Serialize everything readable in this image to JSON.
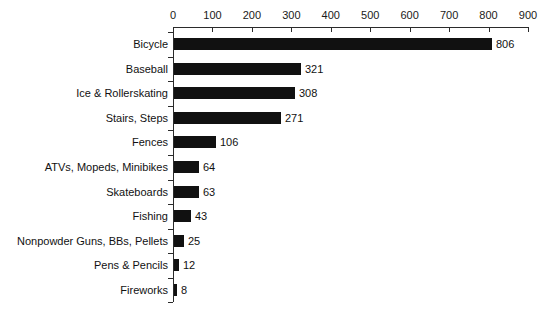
{
  "chart_data": {
    "type": "bar",
    "orientation": "horizontal",
    "title": "",
    "subtitle": "",
    "xlabel": "",
    "ylabel": "",
    "xlim": [
      0,
      900
    ],
    "grid": false,
    "legend": null,
    "axis_position": "top",
    "xticks": [
      0,
      100,
      200,
      300,
      400,
      500,
      600,
      700,
      800,
      900
    ],
    "xtick_labels": [
      "0",
      "100",
      "200",
      "300",
      "400",
      "500",
      "600",
      "700",
      "800",
      "900"
    ],
    "categories": [
      "Bicycle",
      "Baseball",
      "Ice & Rollerskating",
      "Stairs, Steps",
      "Fences",
      "ATVs, Mopeds, Minibikes",
      "Skateboards",
      "Fishing",
      "Nonpowder Guns, BBs, Pellets",
      "Pens & Pencils",
      "Fireworks"
    ],
    "values": [
      806,
      321,
      308,
      271,
      106,
      64,
      63,
      43,
      25,
      12,
      8
    ],
    "value_labels": [
      "806",
      "321",
      "308",
      "271",
      "106",
      "64",
      "63",
      "43",
      "25",
      "12",
      "8"
    ],
    "bar_color": "#111111",
    "axis_color": "#2b2b2b",
    "background_color": "#ffffff"
  }
}
